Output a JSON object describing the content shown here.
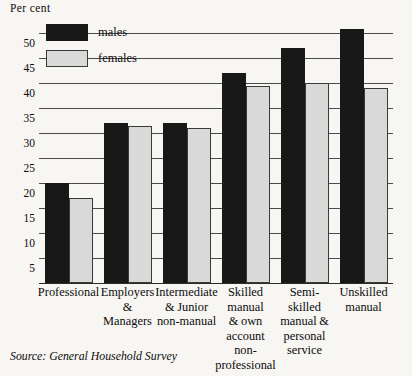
{
  "chart_data": {
    "type": "bar",
    "title": "",
    "ylabel": "Per cent",
    "xlabel": "",
    "ylim": [
      0,
      52.5
    ],
    "yticks": [
      5,
      10,
      15,
      20,
      25,
      30,
      35,
      40,
      45,
      50
    ],
    "grid": true,
    "legend_position": "top-left",
    "categories": [
      "Professional",
      "Employers & Managers",
      "Intermediate & Junior non-manual",
      "Skilled manual & own account non-professional",
      "Semi-skilled manual & personal service",
      "Unskilled manual"
    ],
    "category_lines": [
      [
        "Professional"
      ],
      [
        "Employers",
        "&",
        "Managers"
      ],
      [
        "Intermediate",
        "& Junior",
        "non-manual"
      ],
      [
        "Skilled",
        "manual",
        "& own",
        "account",
        "non-",
        "professional"
      ],
      [
        "Semi-",
        "skilled",
        "manual &",
        "personal",
        "service"
      ],
      [
        "Unskilled",
        "manual"
      ]
    ],
    "series": [
      {
        "name": "males",
        "color": "#181818",
        "values": [
          20,
          32,
          32,
          42,
          47,
          51
        ]
      },
      {
        "name": "females",
        "color": "#d9d9d9",
        "values": [
          17,
          31.5,
          31,
          39.5,
          40,
          39
        ]
      }
    ],
    "source": "Source: General Household Survey"
  },
  "legend": {
    "items": [
      {
        "label": "males",
        "swatch": "males"
      },
      {
        "label": "females",
        "swatch": "females"
      }
    ]
  }
}
